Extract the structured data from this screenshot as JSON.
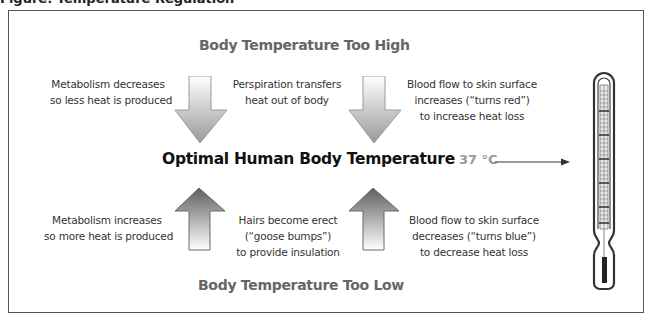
{
  "diagram": {
    "clipped_caption": "Figure: Temperature Regulation",
    "top_heading": "Body Temperature Too High",
    "bottom_heading": "Body Temperature Too Low",
    "center_label": "Optimal Human Body Temperature",
    "temperature_label": "37 °C",
    "too_high_responses": [
      {
        "line1": "Metabolism decreases",
        "line2": "so less heat is produced",
        "line3": ""
      },
      {
        "line1": "Perspiration transfers",
        "line2": "heat out of body",
        "line3": ""
      },
      {
        "line1": "Blood flow to skin surface",
        "line2": "increases (“turns red”)",
        "line3": "to increase heat loss"
      }
    ],
    "too_low_responses": [
      {
        "line1": "Metabolism increases",
        "line2": "so more heat is produced",
        "line3": ""
      },
      {
        "line1": "Hairs become erect",
        "line2": "(“goose bumps”)",
        "line3": "to provide insulation"
      },
      {
        "line1": "Blood flow to skin surface",
        "line2": "decreases (“turns blue”)",
        "line3": "to decrease heat loss"
      }
    ],
    "icons": {
      "down_arrow": "down-arrow-icon",
      "up_arrow": "up-arrow-icon",
      "pointer_arrow": "right-arrow-icon",
      "thermometer": "thermometer-icon"
    },
    "colors": {
      "heading": "#666666",
      "center_label": "#111111",
      "temperature_label": "#999999",
      "down_arrow_top": "#ffffff",
      "down_arrow_bottom": "#999999",
      "up_arrow_top": "#5f5f5f",
      "up_arrow_bottom": "#ffffff",
      "frame": "#555555"
    }
  }
}
